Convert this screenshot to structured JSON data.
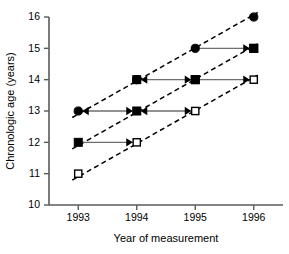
{
  "chart_data": {
    "type": "scatter",
    "title": "",
    "xlabel": "Year of measurement",
    "ylabel": "Chronologic age (years)",
    "xlim": [
      1992.5,
      1996.5
    ],
    "ylim": [
      10,
      16
    ],
    "grid": false,
    "legend": "none",
    "x_ticks": [
      "1993",
      "1994",
      "1995",
      "1996"
    ],
    "x_tick_values": [
      1993,
      1994,
      1995,
      1996
    ],
    "y_ticks": [
      "10",
      "11",
      "12",
      "13",
      "14",
      "15",
      "16"
    ],
    "y_tick_values": [
      10,
      11,
      12,
      13,
      14,
      15,
      16
    ],
    "series": [
      {
        "name": "filled-circle",
        "marker": "filled-circle",
        "x": [
          1993,
          1994,
          1995,
          1996
        ],
        "values": [
          13,
          14,
          15,
          16
        ]
      },
      {
        "name": "filled-square",
        "marker": "filled-square",
        "x": [
          1993,
          1994,
          1995,
          1996
        ],
        "values": [
          12,
          13,
          14,
          15
        ]
      },
      {
        "name": "open-square",
        "marker": "open-square",
        "x": [
          1993,
          1994,
          1995,
          1996
        ],
        "values": [
          11,
          12,
          13,
          14
        ]
      },
      {
        "name": "filled-square-upper",
        "marker": "filled-square",
        "x": [
          1994,
          1995,
          1996
        ],
        "values": [
          14,
          14,
          15
        ]
      }
    ],
    "trend_lines": [
      {
        "name": "trend-circle",
        "x": [
          1993,
          1996
        ],
        "y": [
          13,
          16
        ],
        "style": "dashed"
      },
      {
        "name": "trend-square",
        "x": [
          1993,
          1996
        ],
        "y": [
          12,
          15
        ],
        "style": "dashed"
      },
      {
        "name": "trend-open-square",
        "x": [
          1993,
          1996
        ],
        "y": [
          11,
          14
        ],
        "style": "dashed"
      }
    ],
    "connectors": [
      {
        "name": "connector-age-15",
        "y": 15,
        "x_from": 1995,
        "x_to": 1996,
        "arrow": "right"
      },
      {
        "name": "connector-age-14a",
        "y": 14,
        "x_from": 1994,
        "x_to": 1995,
        "arrow": "both"
      },
      {
        "name": "connector-age-14b",
        "y": 14,
        "x_from": 1995,
        "x_to": 1996,
        "arrow": "right"
      },
      {
        "name": "connector-age-13a",
        "y": 13,
        "x_from": 1993,
        "x_to": 1994,
        "arrow": "both"
      },
      {
        "name": "connector-age-13b",
        "y": 13,
        "x_from": 1994,
        "x_to": 1995,
        "arrow": "both"
      },
      {
        "name": "connector-age-12",
        "y": 12,
        "x_from": 1993,
        "x_to": 1994,
        "arrow": "right"
      }
    ]
  }
}
